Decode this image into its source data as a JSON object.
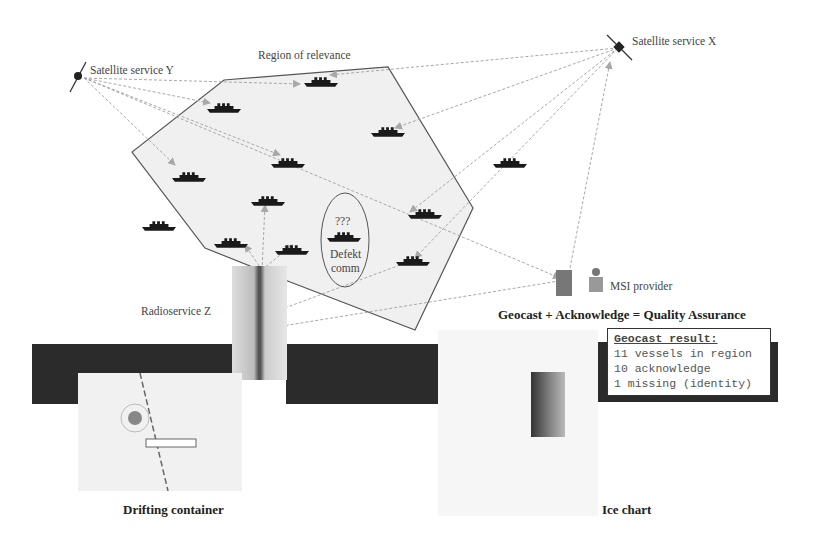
{
  "diagram": {
    "labels": {
      "satellite_y": "Satellite service Y",
      "satellite_x": "Satellite service X",
      "region": "Region of relevance",
      "radioservice": "Radioservice  Z",
      "msi_provider": "MSI provider",
      "defekt_q": "???",
      "defekt_l1": "Defekt",
      "defekt_l2": "comm",
      "headline": "Geocast + Acknowledge = Quality Assurance",
      "drifting": "Drifting container",
      "ice": "Ice chart"
    },
    "result_box": {
      "title": "Geocast result:",
      "lines": [
        "11 vessels in region",
        "10 acknowledge",
        "1 missing (identity)"
      ]
    },
    "colors": {
      "region_fill": "#f0f0f0",
      "region_stroke": "#555555",
      "arrow": "#a8a8a8",
      "band": "#2b2b2b",
      "ship": "#1a1a1a"
    }
  }
}
